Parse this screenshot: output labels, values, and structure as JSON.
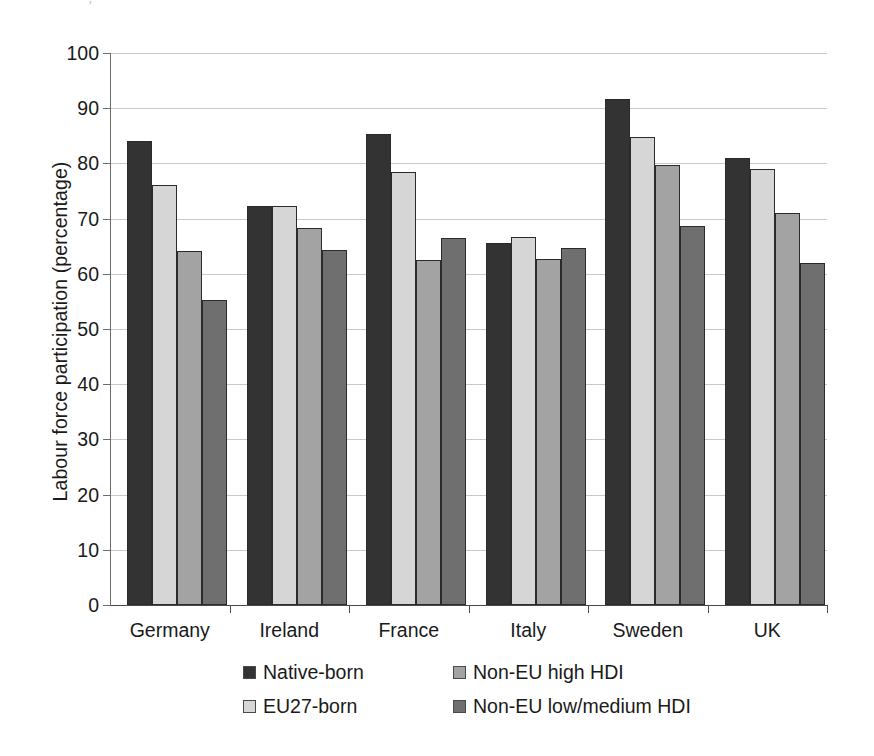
{
  "figure": {
    "artifact_glyph": "'"
  },
  "chart_data": {
    "type": "bar",
    "title": "",
    "xlabel": "",
    "ylabel": "Labour force participation (percentage)",
    "ylim": [
      0,
      100
    ],
    "ytick_step": 10,
    "yticks": [
      0,
      10,
      20,
      30,
      40,
      50,
      60,
      70,
      80,
      90,
      100
    ],
    "ytick_labels": [
      "0",
      "10",
      "20",
      "30",
      "40",
      "50",
      "60",
      "70",
      "80",
      "90",
      "100"
    ],
    "grid": "horizontal",
    "legend_position": "bottom",
    "categories": [
      "Germany",
      "Ireland",
      "France",
      "Italy",
      "Sweden",
      "UK"
    ],
    "series": [
      {
        "name": "Native-born",
        "color": "#333333",
        "values": [
          84.1,
          72.2,
          85.3,
          65.5,
          91.7,
          80.9
        ]
      },
      {
        "name": "EU27-born",
        "color": "#d6d6d6",
        "values": [
          76.1,
          72.2,
          78.4,
          66.7,
          84.7,
          78.9
        ]
      },
      {
        "name": "Non-EU high HDI",
        "color": "#a3a3a3",
        "values": [
          64.2,
          68.3,
          62.5,
          62.6,
          79.7,
          71.0
        ]
      },
      {
        "name": "Non-EU low/medium HDI",
        "color": "#6f6f6f",
        "values": [
          55.2,
          64.3,
          66.4,
          64.6,
          68.7,
          62.0
        ]
      }
    ]
  }
}
